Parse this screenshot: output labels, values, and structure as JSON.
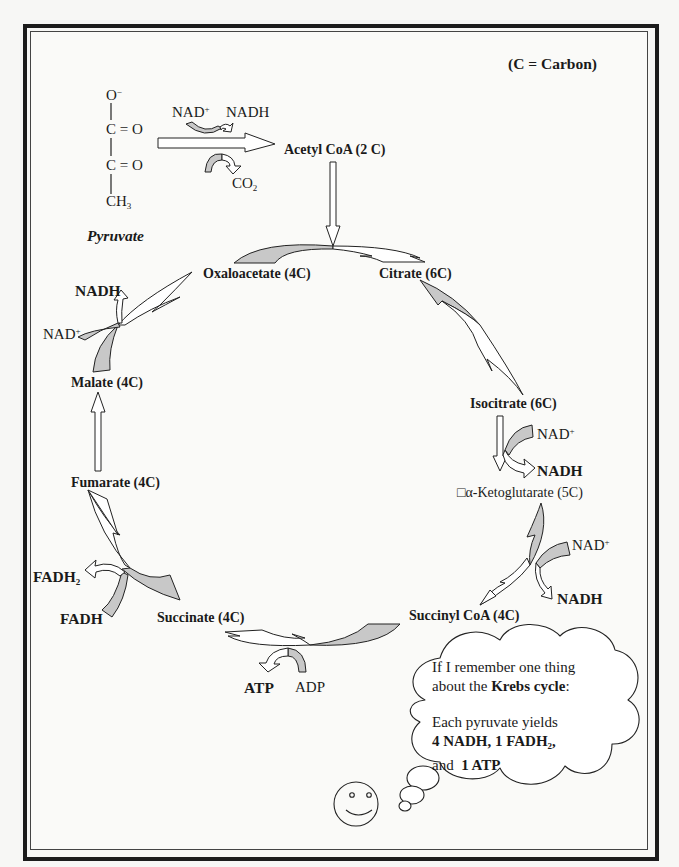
{
  "legend": {
    "text": "(C = Carbon)"
  },
  "pyruvate": {
    "label": "Pyruvate",
    "structure": {
      "oxygen_minus": "O",
      "oxygen_minus_sup": "−",
      "carbonyl_1": "C = O",
      "carbonyl_2": "C = O",
      "methyl": "CH",
      "methyl_sub": "3"
    }
  },
  "link_reaction": {
    "cofactor_in": "NAD",
    "cofactor_in_sup": "+",
    "cofactor_out": "NADH",
    "byproduct": "CO",
    "byproduct_sub": "2"
  },
  "intermediates": {
    "acetyl_coa": "Acetyl CoA (2 C)",
    "oxaloacetate": "Oxaloacetate (4C)",
    "citrate": "Citrate (6C)",
    "isocitrate": "Isocitrate (6C)",
    "alpha_ketoglutarate": "□α-Ketoglutarate (5C)",
    "succinyl_coa": "Succinyl CoA (4C)",
    "succinate": "Succinate (4C)",
    "fumarate": "Fumarate (4C)",
    "malate": "Malate (4C)"
  },
  "cofactors": {
    "isocitrate_step": {
      "in": "NAD",
      "in_sup": "+",
      "out": "NADH"
    },
    "ketoglutarate_step": {
      "in": "NAD",
      "in_sup": "+",
      "out": "NADH"
    },
    "succinyl_step": {
      "in": "ADP",
      "out": "ATP"
    },
    "succinate_step": {
      "in": "FADH",
      "out": "FADH",
      "out_sub": "2"
    },
    "malate_step": {
      "in": "NAD",
      "in_sup": "+",
      "out": "NADH"
    }
  },
  "thought_bubble": {
    "line1": "If I remember one thing",
    "line2_pre": "about the ",
    "line2_bold": "Krebs cycle",
    "line2_post": ":",
    "line3": "Each pyruvate yields",
    "line4_bold_a": "4 NADH, 1 FADH",
    "line4_sub": "2",
    "line4_post": ",",
    "line5_pre": "and  ",
    "line5_bold": "1 ATP"
  },
  "colors": {
    "arrow_fill_gray": "#c8c8c8",
    "arrow_fill_white": "#ffffff",
    "stroke": "#222222",
    "frame": "#1c1c1c"
  }
}
